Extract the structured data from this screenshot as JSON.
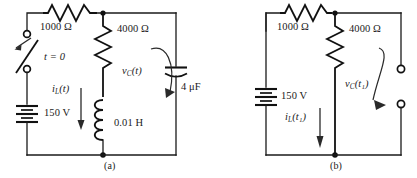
{
  "figure": {
    "caption_a": "(a)",
    "caption_b": "(b)"
  },
  "circuit_a": {
    "name": "RLC circuit with switch at t = 0",
    "switch_label": "t = 0",
    "source_label": "150 V",
    "series_resistor_label": "1000 Ω",
    "parallel_resistor_label": "4000 Ω",
    "inductor_label": "0.01 H",
    "capacitor_label": "4 μF",
    "inductor_current_var": "i",
    "inductor_current_sub": "L",
    "inductor_current_arg": "(t)",
    "capacitor_voltage_var": "v",
    "capacitor_voltage_sub": "C",
    "capacitor_voltage_arg": "(t)"
  },
  "circuit_b": {
    "name": "DC steady-state equivalent circuit at t = t1",
    "source_label": "150 V",
    "series_resistor_label": "1000 Ω",
    "parallel_resistor_label": "4000 Ω",
    "inductor_current_var": "i",
    "inductor_current_sub": "L",
    "inductor_current_arg": "(t₁)",
    "capacitor_voltage_var": "v",
    "capacitor_voltage_sub": "C",
    "capacitor_voltage_arg": "(t₁)"
  },
  "colors": {
    "ink": "#111111",
    "wire": "#1a1a1a",
    "annotation": "#2a2a2a",
    "background": "#ffffff"
  }
}
